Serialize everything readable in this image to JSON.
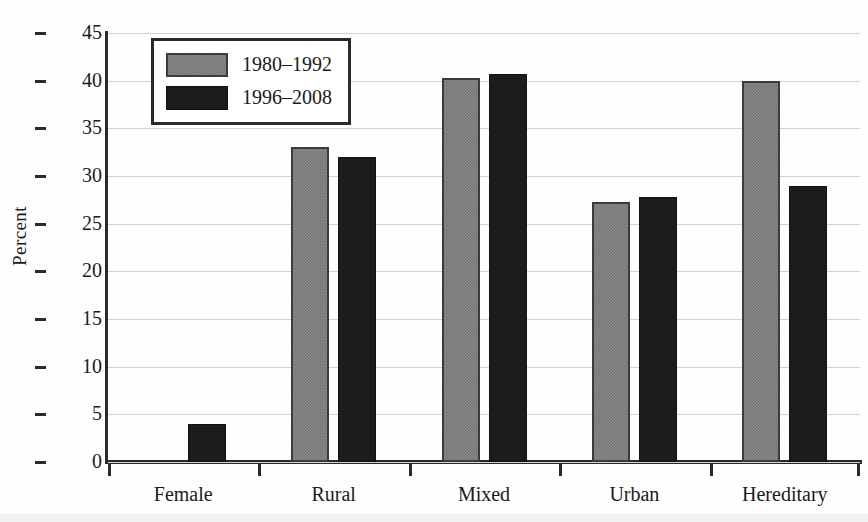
{
  "chart_data": {
    "type": "bar",
    "title": "",
    "xlabel": "",
    "ylabel": "Percent",
    "ylim": [
      0,
      45
    ],
    "yticks": [
      0,
      5,
      10,
      15,
      20,
      25,
      30,
      35,
      40,
      45
    ],
    "grid": true,
    "legend_position": "top-left",
    "categories": [
      "Female",
      "Rural",
      "Mixed",
      "Urban",
      "Hereditary"
    ],
    "series": [
      {
        "name": "1980–1992",
        "color": "#8a8a8a",
        "values": [
          0,
          33,
          40.3,
          27.3,
          40
        ]
      },
      {
        "name": "1996–2008",
        "color": "#1c1c1c",
        "values": [
          4,
          32,
          40.7,
          27.8,
          29
        ]
      }
    ]
  }
}
